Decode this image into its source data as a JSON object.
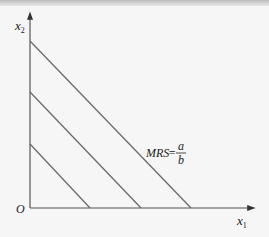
{
  "diagram": {
    "type": "indifference-curves-perfect-substitutes",
    "axes": {
      "x_label": "x",
      "x_sub": "1",
      "y_label": "x",
      "y_sub": "2",
      "origin_label": "O"
    },
    "annotation": {
      "text": "MRS",
      "equals": "=",
      "numerator": "a",
      "denominator": "b"
    },
    "lines": [
      {
        "y_intercept_px": 144,
        "x_intercept_px": 90
      },
      {
        "y_intercept_px": 92,
        "x_intercept_px": 141
      },
      {
        "y_intercept_px": 41,
        "x_intercept_px": 191
      }
    ],
    "colors": {
      "axis": "#555555",
      "line": "#6a6a6a",
      "background": "#f6f6f6"
    }
  }
}
